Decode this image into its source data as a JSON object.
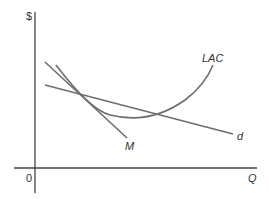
{
  "diagram": {
    "y_axis_label": "$",
    "x_axis_label": "Q",
    "origin_label": "0",
    "curves": [
      {
        "id": "LAC",
        "label": "LAC",
        "type": "U-shaped long-run average cost curve"
      },
      {
        "id": "d",
        "label": "d",
        "type": "demand line (shallow downward slope)"
      },
      {
        "id": "M",
        "label": "M",
        "type": "steep downward-sloping line"
      }
    ],
    "colors": {
      "lines": "#6e6e6e",
      "axes": "#333333",
      "text": "#333333"
    }
  }
}
